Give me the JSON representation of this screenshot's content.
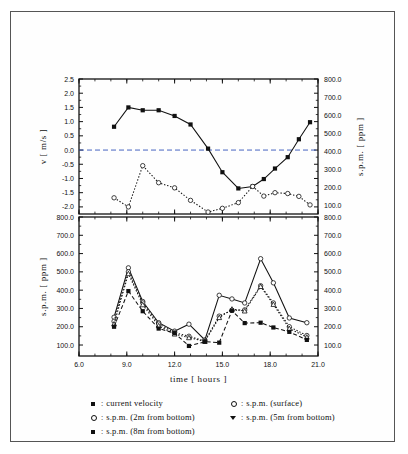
{
  "figure": {
    "panels": [
      "velocity-spm-panel",
      "spm-panel"
    ]
  },
  "chart_data": [
    {
      "id": "top-panel",
      "type": "line",
      "title": "",
      "xlabel": "",
      "ylabel": "v [ m/s ]",
      "y2label": "s.p.m. [ ppm ]",
      "xlim": [
        6.0,
        21.0
      ],
      "ylim": [
        -2.25,
        2.5
      ],
      "y2lim": [
        50.0,
        800.0
      ],
      "grid": false,
      "legend_position": "below-figure",
      "xticks": [
        6.0,
        9.0,
        12.0,
        15.0,
        18.0,
        21.0
      ],
      "xticklabels": [
        "6.0",
        "9.0",
        "12.0",
        "15.0",
        "18.0",
        "21.0"
      ],
      "yticks": [
        2.5,
        2.0,
        1.5,
        1.0,
        0.5,
        0.0,
        -0.5,
        -1.0,
        -1.5,
        -2.0
      ],
      "yticklabels": [
        "2.5",
        "2.0",
        "1.5",
        "1.0",
        "0.5",
        "0.0",
        "-0.5",
        "-1.0",
        "-1.5",
        "-2.0"
      ],
      "y2ticks": [
        800.0,
        700.0,
        600.0,
        500.0,
        400.0,
        300.0,
        200.0,
        100.0
      ],
      "y2ticklabels": [
        "800.0",
        "700.0",
        "600.0",
        "500.0",
        "400.0",
        "300.0",
        "200.0",
        "100.0"
      ],
      "zero_reference_line": 0.0,
      "series": [
        {
          "name": "current velocity",
          "axis": "left",
          "marker": "filled-square",
          "linestyle": "solid",
          "x": [
            8.2,
            9.1,
            10.0,
            11.0,
            12.0,
            13.0,
            14.1,
            15.0,
            16.0,
            16.9,
            17.6,
            18.3,
            19.1,
            19.8,
            20.5
          ],
          "y": [
            0.82,
            1.5,
            1.4,
            1.4,
            1.2,
            0.9,
            0.05,
            -0.78,
            -1.35,
            -1.28,
            -1.02,
            -0.65,
            -0.25,
            0.38,
            0.98
          ]
        },
        {
          "name": "s.p.m. (surface)",
          "axis": "right",
          "marker": "open-circle",
          "linestyle": "dotted",
          "x": [
            8.2,
            9.1,
            10.0,
            11.0,
            12.0,
            13.0,
            14.1,
            15.0,
            16.0,
            16.9,
            17.6,
            18.3,
            19.1,
            19.8,
            20.5
          ],
          "y_left_equivalent": [
            -1.68,
            -2.0,
            -0.55,
            -1.15,
            -1.33,
            -1.77,
            -2.18,
            -2.05,
            -1.85,
            -1.28,
            -1.62,
            -1.5,
            -1.53,
            -1.63,
            -1.93
          ],
          "y": [
            136,
            110,
            300,
            248,
            230,
            192,
            152,
            163,
            180,
            236,
            207,
            217,
            214,
            205,
            180
          ]
        }
      ]
    },
    {
      "id": "bottom-panel",
      "type": "line",
      "title": "",
      "xlabel": "time [ hours ]",
      "ylabel": "s.p.m. [ ppm ]",
      "y2label": "",
      "xlim": [
        6.0,
        21.0
      ],
      "ylim": [
        40.0,
        800.0
      ],
      "y2lim": [
        40.0,
        800.0
      ],
      "grid": false,
      "legend_position": "below-figure",
      "xticks": [
        6.0,
        9.0,
        12.0,
        15.0,
        18.0,
        21.0
      ],
      "xticklabels": [
        "6.0",
        "9.0",
        "12.0",
        "15.0",
        "18.0",
        "21.0"
      ],
      "yticks": [
        800.0,
        700.0,
        600.0,
        500.0,
        400.0,
        300.0,
        200.0,
        100.0
      ],
      "yticklabels": [
        "800.0",
        "700.0",
        "600.0",
        "500.0",
        "400.0",
        "300.0",
        "200.0",
        "100.0"
      ],
      "y2ticks": [
        800.0,
        700.0,
        600.0,
        500.0,
        400.0,
        300.0,
        200.0,
        100.0
      ],
      "y2ticklabels": [
        "800.0",
        "700.0",
        "600.0",
        "500.0",
        "400.0",
        "300.0",
        "200.0",
        "100.0"
      ],
      "series": [
        {
          "name": "s.p.m. (surface)",
          "marker": "open-circle",
          "linestyle": "solid",
          "x": [
            8.2,
            9.1,
            10.0,
            11.0,
            12.0,
            12.9,
            13.9,
            14.8,
            15.6,
            16.4,
            17.4,
            18.2,
            19.2,
            20.3
          ],
          "y": [
            252,
            522,
            338,
            222,
            176,
            214,
            128,
            372,
            352,
            330,
            572,
            440,
            248,
            222
          ]
        },
        {
          "name": "s.p.m. (2m from bottom)",
          "marker": "open-circle",
          "linestyle": "dotted",
          "x": [
            8.2,
            9.1,
            10.0,
            11.0,
            12.0,
            12.9,
            13.9,
            14.8,
            15.6,
            16.4,
            17.4,
            18.2,
            19.2,
            20.3
          ],
          "y": [
            230,
            500,
            330,
            215,
            168,
            148,
            122,
            258,
            290,
            292,
            424,
            330,
            200,
            152
          ]
        },
        {
          "name": "s.p.m. (5m from bottom)",
          "marker": "open-triangle",
          "linestyle": "dotted",
          "x": [
            8.2,
            9.1,
            10.0,
            11.0,
            12.0,
            12.9,
            13.9,
            14.8,
            15.6,
            16.4,
            17.4,
            18.2,
            19.2,
            20.3
          ],
          "y": [
            215,
            490,
            320,
            205,
            160,
            140,
            120,
            250,
            296,
            286,
            420,
            322,
            190,
            143
          ]
        },
        {
          "name": "s.p.m. (8m from bottom)",
          "marker": "filled-square",
          "linestyle": "dashed",
          "x": [
            8.2,
            9.1,
            10.0,
            11.0,
            12.0,
            12.9,
            13.9,
            14.8,
            15.6,
            16.4,
            17.4,
            18.2,
            19.2,
            20.3
          ],
          "y": [
            200,
            395,
            285,
            190,
            165,
            95,
            118,
            113,
            288,
            220,
            222,
            196,
            172,
            128
          ]
        }
      ]
    }
  ],
  "legend": {
    "entries": [
      {
        "marker": "filled-square",
        "separator": ":",
        "label": "current velocity",
        "column": "left"
      },
      {
        "marker": "open-circle",
        "separator": ":",
        "label": "s.p.m. (2m from bottom)",
        "column": "left"
      },
      {
        "marker": "filled-square",
        "separator": ":",
        "label": "s.p.m. (8m from bottom)",
        "column": "left"
      },
      {
        "marker": "open-circle",
        "separator": ":",
        "label": "s.p.m. (surface)",
        "column": "right"
      },
      {
        "marker": "open-triangle",
        "separator": ":",
        "label": "s.p.m. (5m from bottom)",
        "column": "right"
      }
    ]
  },
  "colors": {
    "ink": "#111111",
    "frame": "#555555",
    "background": "#ffffff"
  }
}
